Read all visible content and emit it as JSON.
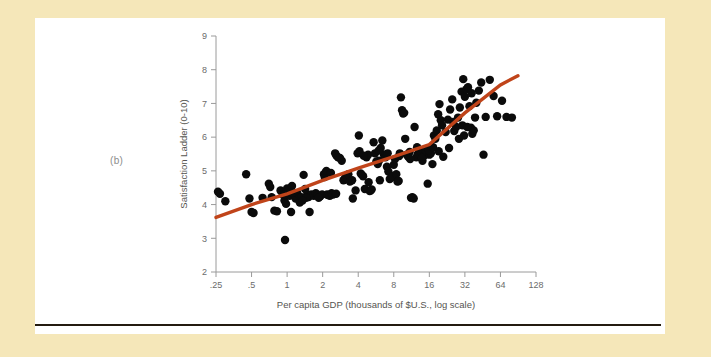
{
  "figure": {
    "panel_label": "(b)",
    "background_color": "#f5e7b9",
    "panel_color": "#ffffff",
    "rule_color": "#241b10"
  },
  "chart_data": {
    "type": "scatter",
    "title": "",
    "xlabel": "Per capita GDP (thousands of $U.S., log scale)",
    "ylabel": "Satisfaction Ladder (0-10)",
    "x_scale": "log2",
    "xlim": [
      0.25,
      128
    ],
    "ylim": [
      2,
      9
    ],
    "grid": false,
    "legend": null,
    "xticks": [
      0.25,
      0.5,
      1,
      2,
      4,
      8,
      16,
      32,
      64,
      128
    ],
    "xtick_labels": [
      ".25",
      ".5",
      "1",
      "2",
      "4",
      "8",
      "16",
      "32",
      "64",
      "128"
    ],
    "yticks": [
      2,
      3,
      4,
      5,
      6,
      7,
      8,
      9
    ],
    "ytick_labels": [
      "2",
      "3",
      "4",
      "5",
      "6",
      "7",
      "8",
      "9"
    ],
    "marker_color": "#0b0b0b",
    "marker_size": 4.2,
    "points": [
      [
        0.26,
        4.38
      ],
      [
        0.27,
        4.32
      ],
      [
        0.3,
        4.1
      ],
      [
        0.45,
        4.9
      ],
      [
        0.48,
        4.18
      ],
      [
        0.5,
        3.78
      ],
      [
        0.52,
        3.75
      ],
      [
        0.62,
        4.2
      ],
      [
        0.7,
        4.62
      ],
      [
        0.72,
        4.52
      ],
      [
        0.74,
        4.22
      ],
      [
        0.78,
        3.82
      ],
      [
        0.82,
        3.8
      ],
      [
        0.88,
        4.42
      ],
      [
        0.92,
        4.3
      ],
      [
        0.95,
        4.12
      ],
      [
        0.96,
        2.95
      ],
      [
        0.98,
        4.02
      ],
      [
        1.0,
        4.48
      ],
      [
        1.02,
        4.4
      ],
      [
        1.05,
        4.26
      ],
      [
        1.08,
        3.78
      ],
      [
        1.1,
        4.55
      ],
      [
        1.15,
        4.28
      ],
      [
        1.18,
        4.18
      ],
      [
        1.22,
        4.34
      ],
      [
        1.28,
        4.06
      ],
      [
        1.32,
        4.22
      ],
      [
        1.38,
        4.88
      ],
      [
        1.42,
        4.46
      ],
      [
        1.48,
        4.3
      ],
      [
        1.52,
        4.22
      ],
      [
        1.55,
        3.78
      ],
      [
        1.6,
        4.3
      ],
      [
        1.68,
        4.26
      ],
      [
        1.75,
        4.34
      ],
      [
        1.82,
        4.28
      ],
      [
        1.9,
        4.24
      ],
      [
        1.98,
        4.3
      ],
      [
        2.05,
        4.9
      ],
      [
        2.08,
        4.82
      ],
      [
        2.12,
        4.95
      ],
      [
        2.18,
        4.3
      ],
      [
        2.22,
        4.28
      ],
      [
        2.3,
        4.26
      ],
      [
        2.38,
        4.34
      ],
      [
        2.45,
        4.3
      ],
      [
        2.55,
        5.52
      ],
      [
        2.62,
        5.45
      ],
      [
        2.7,
        5.4
      ],
      [
        2.8,
        5.38
      ],
      [
        2.9,
        5.3
      ],
      [
        3.0,
        4.72
      ],
      [
        3.1,
        4.8
      ],
      [
        3.2,
        4.86
      ],
      [
        3.4,
        4.68
      ],
      [
        3.6,
        4.18
      ],
      [
        3.8,
        4.42
      ],
      [
        3.95,
        5.52
      ],
      [
        4.05,
        6.05
      ],
      [
        4.1,
        5.58
      ],
      [
        4.2,
        4.92
      ],
      [
        4.3,
        4.88
      ],
      [
        4.4,
        4.84
      ],
      [
        4.55,
        4.46
      ],
      [
        4.7,
        5.4
      ],
      [
        4.85,
        5.48
      ],
      [
        5.0,
        4.4
      ],
      [
        5.1,
        4.42
      ],
      [
        5.2,
        4.45
      ],
      [
        5.4,
        5.85
      ],
      [
        5.55,
        5.52
      ],
      [
        5.7,
        5.28
      ],
      [
        5.85,
        5.2
      ],
      [
        6.0,
        5.3
      ],
      [
        6.2,
        5.68
      ],
      [
        6.4,
        5.9
      ],
      [
        6.6,
        5.48
      ],
      [
        6.8,
        5.4
      ],
      [
        7.0,
        5.12
      ],
      [
        7.2,
        4.98
      ],
      [
        7.4,
        4.76
      ],
      [
        7.6,
        4.8
      ],
      [
        7.8,
        4.84
      ],
      [
        8.0,
        5.18
      ],
      [
        8.2,
        5.35
      ],
      [
        8.4,
        4.9
      ],
      [
        8.6,
        4.68
      ],
      [
        8.8,
        4.7
      ],
      [
        9.0,
        5.52
      ],
      [
        9.2,
        7.18
      ],
      [
        9.4,
        6.8
      ],
      [
        9.6,
        6.7
      ],
      [
        9.8,
        6.72
      ],
      [
        10.0,
        5.95
      ],
      [
        10.3,
        5.48
      ],
      [
        10.6,
        5.42
      ],
      [
        10.9,
        5.56
      ],
      [
        11.2,
        4.2
      ],
      [
        11.5,
        4.22
      ],
      [
        11.8,
        4.18
      ],
      [
        12.0,
        6.3
      ],
      [
        12.4,
        5.4
      ],
      [
        12.8,
        5.5
      ],
      [
        13.2,
        5.52
      ],
      [
        13.6,
        5.56
      ],
      [
        14.0,
        5.3
      ],
      [
        14.5,
        5.46
      ],
      [
        15.0,
        5.58
      ],
      [
        15.5,
        4.62
      ],
      [
        16.0,
        5.48
      ],
      [
        16.5,
        5.52
      ],
      [
        17.0,
        5.2
      ],
      [
        17.5,
        6.05
      ],
      [
        18.0,
        5.95
      ],
      [
        18.5,
        6.2
      ],
      [
        19.0,
        6.68
      ],
      [
        19.5,
        6.98
      ],
      [
        20.0,
        6.5
      ],
      [
        21.0,
        5.42
      ],
      [
        22.0,
        6.15
      ],
      [
        23.0,
        6.52
      ],
      [
        24.0,
        6.82
      ],
      [
        25.0,
        7.12
      ],
      [
        26.0,
        6.18
      ],
      [
        27.0,
        6.3
      ],
      [
        28.0,
        6.58
      ],
      [
        29.0,
        6.88
      ],
      [
        30.0,
        7.35
      ],
      [
        31.0,
        7.72
      ],
      [
        32.0,
        7.2
      ],
      [
        33.0,
        7.42
      ],
      [
        34.0,
        7.48
      ],
      [
        35.0,
        6.92
      ],
      [
        36.0,
        6.28
      ],
      [
        37.0,
        6.1
      ],
      [
        38.0,
        6.2
      ],
      [
        39.0,
        6.58
      ],
      [
        40.0,
        7.02
      ],
      [
        42.0,
        7.38
      ],
      [
        44.0,
        7.62
      ],
      [
        46.0,
        5.48
      ],
      [
        48.0,
        6.6
      ],
      [
        52.0,
        7.7
      ],
      [
        56.0,
        7.22
      ],
      [
        60.0,
        6.62
      ],
      [
        66.0,
        7.08
      ],
      [
        72.0,
        6.6
      ],
      [
        80.0,
        6.58
      ],
      [
        0.95,
        4.3
      ],
      [
        1.12,
        4.36
      ],
      [
        1.45,
        4.2
      ],
      [
        2.15,
        5.0
      ],
      [
        2.35,
        4.94
      ],
      [
        3.3,
        4.9
      ],
      [
        4.45,
        5.45
      ],
      [
        5.95,
        5.6
      ],
      [
        7.1,
        5.52
      ],
      [
        8.9,
        5.44
      ],
      [
        12.6,
        5.7
      ],
      [
        15.8,
        5.62
      ],
      [
        20.5,
        6.35
      ],
      [
        25.5,
        6.45
      ],
      [
        30.5,
        6.35
      ],
      [
        33.5,
        6.3
      ],
      [
        36.5,
        7.3
      ],
      [
        31.5,
        6.05
      ],
      [
        28.5,
        5.95
      ],
      [
        23.5,
        5.68
      ],
      [
        19.2,
        5.58
      ],
      [
        17.2,
        5.7
      ],
      [
        13.8,
        5.38
      ],
      [
        11.0,
        5.35
      ],
      [
        6.1,
        4.72
      ],
      [
        4.9,
        4.66
      ],
      [
        3.55,
        4.72
      ],
      [
        2.6,
        4.32
      ],
      [
        1.85,
        4.2
      ],
      [
        1.35,
        4.12
      ]
    ],
    "trend_line": {
      "color": "#c0441a",
      "width": 3.4,
      "points": [
        [
          0.25,
          3.62
        ],
        [
          0.5,
          4.0
        ],
        [
          1,
          4.32
        ],
        [
          2,
          4.72
        ],
        [
          4,
          5.08
        ],
        [
          8,
          5.42
        ],
        [
          16,
          5.78
        ],
        [
          32,
          6.72
        ],
        [
          64,
          7.55
        ],
        [
          90,
          7.82
        ]
      ]
    }
  }
}
